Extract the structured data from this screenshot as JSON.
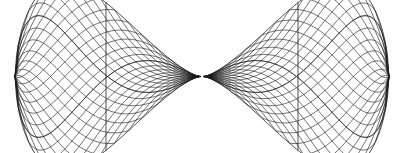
{
  "figure": {
    "background_color": "#ffffff",
    "line_color": "#1c1c1c",
    "canvas": {
      "width": 404,
      "height": 153
    },
    "lobes": [
      {
        "name": "left-lobe",
        "outer_vertex_x": 15,
        "cusp_x": 200,
        "center_y": 76.5,
        "top_y": 9,
        "bottom_y": 145,
        "axis_x": 106,
        "orientation": "cusp-right"
      },
      {
        "name": "right-lobe",
        "outer_vertex_x": 389,
        "cusp_x": 204,
        "center_y": 76.5,
        "top_y": 9,
        "bottom_y": 145,
        "axis_x": 298,
        "orientation": "cusp-left"
      }
    ],
    "grid": {
      "family_count": 2,
      "curves_per_family": 13,
      "stroke_width": 0.62
    },
    "junction": {
      "x": 202,
      "y": 76.5
    }
  }
}
